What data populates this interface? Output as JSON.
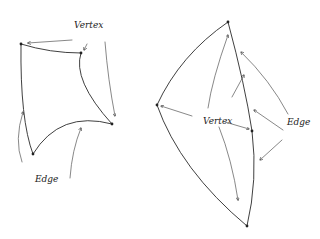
{
  "diagram": {
    "type": "hand-drawn sketch",
    "background": "#ffffff",
    "ink_color": "#2a2a2a",
    "left_shape": {
      "description": "curved quadrilateral patch",
      "vertices": [
        [
          21,
          44
        ],
        [
          81,
          53
        ],
        [
          112,
          124
        ],
        [
          33,
          154
        ]
      ],
      "labels": {
        "vertex": "Vertex",
        "edge": "Edge"
      }
    },
    "right_shape": {
      "description": "curved triangular patches sharing an edge (kite)",
      "vertices": [
        [
          228,
          22
        ],
        [
          157,
          105
        ],
        [
          252,
          131
        ],
        [
          247,
          226
        ]
      ],
      "labels": {
        "vertex": "Vertex",
        "edge": "Edge"
      }
    }
  }
}
